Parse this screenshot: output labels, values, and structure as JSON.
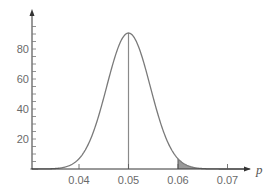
{
  "chart_data": {
    "type": "area",
    "title": "",
    "xlabel": "p",
    "ylabel": "",
    "distribution": {
      "kind": "normal",
      "mean": 0.05,
      "sd": 0.0044
    },
    "xlim": [
      0.0295,
      0.0745
    ],
    "ylim": [
      0,
      102
    ],
    "x_ticks": [
      0.04,
      0.05,
      0.06,
      0.07
    ],
    "x_tick_labels": [
      "0.04",
      "0.05",
      "0.06",
      "0.07"
    ],
    "y_ticks": [
      20,
      40,
      60,
      80
    ],
    "y_tick_labels": [
      "20",
      "40",
      "60",
      "80"
    ],
    "y_minor_step": 5,
    "peak": {
      "x": 0.05,
      "y": 90.7
    },
    "mean_line": {
      "x": 0.05
    },
    "shaded_region": {
      "from": 0.06,
      "to": 0.0745,
      "description": "right tail area beyond p = 0.06"
    },
    "series": [
      {
        "name": "sampling distribution density",
        "x": [
          0.03,
          0.035,
          0.04,
          0.0425,
          0.045,
          0.0475,
          0.05,
          0.0525,
          0.055,
          0.0575,
          0.06,
          0.0625,
          0.065,
          0.07
        ],
        "values": [
          0.0,
          0.3,
          6.7,
          21.1,
          47.1,
          77.9,
          90.7,
          77.9,
          47.1,
          21.1,
          6.7,
          1.6,
          0.3,
          0.0
        ]
      }
    ],
    "grid": false,
    "legend": null
  },
  "colors": {
    "curve": "#7a7a7a",
    "axis": "#333333",
    "mean_line": "#8a8a8a",
    "shade": "#9a9a9a",
    "tick_text": "#6a6a6a"
  }
}
